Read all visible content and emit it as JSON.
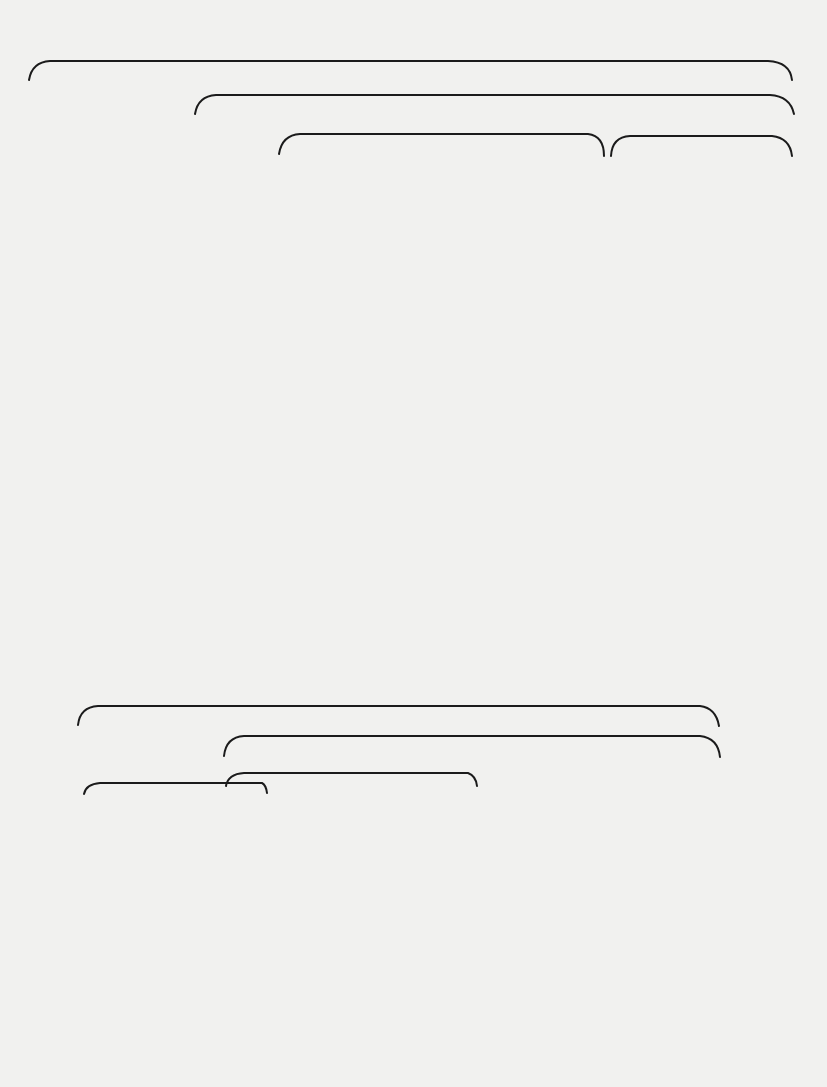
{
  "upper_tree": {
    "clades": [
      {
        "name": "Erinaceomorpha",
        "x": 417,
        "y": 10
      },
      {
        "name": "Erinaceoidea",
        "x": 505,
        "y": 44
      },
      {
        "name": "Erinaceidae",
        "x": 432,
        "y": 82
      },
      {
        "name": "Sespedectidae",
        "x": 700,
        "y": 82
      }
    ],
    "taxa": [
      "Adunator",
      "Litocherus",
      "Talpavoides",
      "Diacodon",
      "Diacocherus",
      "Talpavus",
      "Leipsanolestes",
      "Auroralestes",
      "Dartonius",
      "Litolestes",
      "Cedrocherus",
      "Entomolestes",
      "Ocajila",
      "Lantanotherium",
      "Proterix",
      "Stenoechinus",
      "Untermannerix",
      "Amphechinus",
      "Parvericius",
      "Brachyerix",
      "Metechinus",
      "Macrocranion",
      "Scenopagus",
      "Ankylodon",
      "Sespedectes",
      "Crypholestes",
      "Proterixoides",
      "Patriolestes"
    ]
  },
  "lower_tree": {
    "clades": [
      {
        "name": "Soricomorpha",
        "x": 375,
        "y": 662
      },
      {
        "name": "Soricoidea",
        "x": 487,
        "y": 692
      },
      {
        "name": "Geolabididae",
        "x": 142,
        "y": 767
      },
      {
        "name": "Nyctitheriidae",
        "x": 349,
        "y": 757
      }
    ],
    "taxa": [
      "Centetodon",
      "Batodonoides",
      "Marsholestes",
      "Batodon",
      "Wyonycteris",
      "Pontifactor",
      "Nyctitherium",
      "Plagioctenodon",
      "Leptacodon",
      "Plagioctenoides",
      "Limaconyssus",
      "Ceutholestes",
      "Micropternodus",
      "Cryptoryctes",
      "Clinopternodus",
      "Apternodus",
      "Parapternodus",
      "Koniaryctes",
      "Oligoryctes"
    ]
  },
  "colors": {
    "paper": "#f1f1ef",
    "ink": "#1b1b1b"
  }
}
